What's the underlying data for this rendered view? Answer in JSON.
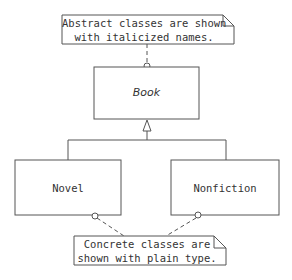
{
  "diagram": {
    "type": "UML class diagram",
    "classes": [
      {
        "id": "book",
        "name": "Book",
        "abstract": true
      },
      {
        "id": "novel",
        "name": "Novel",
        "abstract": false
      },
      {
        "id": "nonfiction",
        "name": "Nonfiction",
        "abstract": false
      }
    ],
    "relations": [
      {
        "type": "generalization",
        "from": "novel",
        "to": "book"
      },
      {
        "type": "generalization",
        "from": "nonfiction",
        "to": "book"
      }
    ],
    "notes": [
      {
        "id": "abstract-note",
        "line1": "Abstract classes are shown",
        "line2": "with italicized names.",
        "attached_to": [
          "book"
        ]
      },
      {
        "id": "concrete-note",
        "line1": "Concrete classes are",
        "line2": "shown with plain type.",
        "attached_to": [
          "novel",
          "nonfiction"
        ]
      }
    ],
    "colors": {
      "stroke": "#555555",
      "text": "#333333",
      "background": "#ffffff"
    }
  }
}
